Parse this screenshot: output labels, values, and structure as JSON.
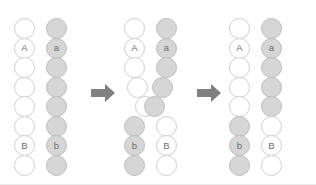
{
  "figure": {
    "background_color": "#ffffff",
    "width": 316,
    "height": 185
  },
  "legend": {
    "white_label": "non-recombinant parental chromatid (dominant alleles)",
    "grey_label": "homologous chromatid (recessive alleles)",
    "white_color": "#ffffff",
    "grey_color": "#d6d6d6",
    "outline_color": "#c9c9c9",
    "label_text_color": "#6e6e6e",
    "arrow_color": "#808080"
  },
  "alleles": {
    "A": "A",
    "a": "a",
    "B": "B",
    "b": "b"
  },
  "arrows": [
    {
      "name": "arrow-step-1",
      "direction": "right",
      "symbol": "➡"
    },
    {
      "name": "arrow-step-2",
      "direction": "right",
      "symbol": "➡"
    }
  ],
  "panels": [
    {
      "name": "panel-before",
      "caption": "Synapsis: homologous chromatids aligned",
      "chromatids": [
        {
          "name": "chromatid-left-parental",
          "beads": [
            {
              "color": "white",
              "label": "",
              "row": 0,
              "shift": 0
            },
            {
              "color": "white",
              "label": "A",
              "row": 1,
              "shift": 0
            },
            {
              "color": "white",
              "label": "",
              "row": 2,
              "shift": 0
            },
            {
              "color": "white",
              "label": "",
              "row": 3,
              "shift": 0
            },
            {
              "color": "white",
              "label": "",
              "row": 4,
              "shift": 0
            },
            {
              "color": "white",
              "label": "",
              "row": 5,
              "shift": 0
            },
            {
              "color": "white",
              "label": "B",
              "row": 6,
              "shift": 0
            },
            {
              "color": "white",
              "label": "",
              "row": 7,
              "shift": 0
            }
          ]
        },
        {
          "name": "chromatid-right-parental",
          "beads": [
            {
              "color": "grey",
              "label": "",
              "row": 0,
              "shift": 0
            },
            {
              "color": "grey",
              "label": "a",
              "row": 1,
              "shift": 0
            },
            {
              "color": "grey",
              "label": "",
              "row": 2,
              "shift": 0
            },
            {
              "color": "grey",
              "label": "",
              "row": 3,
              "shift": 0
            },
            {
              "color": "grey",
              "label": "",
              "row": 4,
              "shift": 0
            },
            {
              "color": "grey",
              "label": "",
              "row": 5,
              "shift": 0
            },
            {
              "color": "grey",
              "label": "b",
              "row": 6,
              "shift": 0
            },
            {
              "color": "grey",
              "label": "",
              "row": 7,
              "shift": 0
            }
          ]
        }
      ]
    },
    {
      "name": "panel-crossover",
      "caption": "Chiasma formation: strands cross and exchange segments",
      "chromatids": [
        {
          "name": "chromatid-left-crossing",
          "beads": [
            {
              "color": "white",
              "label": "",
              "row": 0,
              "shift": 0
            },
            {
              "color": "white",
              "label": "A",
              "row": 1,
              "shift": 0
            },
            {
              "color": "white",
              "label": "",
              "row": 2,
              "shift": 0
            },
            {
              "color": "white",
              "label": "",
              "row": 3,
              "shift": 3
            },
            {
              "color": "white",
              "label": "",
              "row": 4,
              "shift": 11
            },
            {
              "color": "grey",
              "label": "",
              "row": 5,
              "shift": 0
            },
            {
              "color": "grey",
              "label": "b",
              "row": 6,
              "shift": 0
            },
            {
              "color": "grey",
              "label": "",
              "row": 7,
              "shift": 0
            }
          ]
        },
        {
          "name": "chromatid-right-crossing",
          "beads": [
            {
              "color": "grey",
              "label": "",
              "row": 0,
              "shift": 0
            },
            {
              "color": "grey",
              "label": "a",
              "row": 1,
              "shift": 0
            },
            {
              "color": "grey",
              "label": "",
              "row": 2,
              "shift": 0
            },
            {
              "color": "grey",
              "label": "",
              "row": 3,
              "shift": -4
            },
            {
              "color": "grey",
              "label": "",
              "row": 4,
              "shift": -12
            },
            {
              "color": "white",
              "label": "",
              "row": 5,
              "shift": 0
            },
            {
              "color": "white",
              "label": "B",
              "row": 6,
              "shift": 0
            },
            {
              "color": "white",
              "label": "",
              "row": 7,
              "shift": 0
            }
          ]
        }
      ]
    },
    {
      "name": "panel-after",
      "caption": "Recombinant chromatids after exchange",
      "chromatids": [
        {
          "name": "chromatid-left-recombinant",
          "beads": [
            {
              "color": "white",
              "label": "",
              "row": 0,
              "shift": 0
            },
            {
              "color": "white",
              "label": "A",
              "row": 1,
              "shift": 0
            },
            {
              "color": "white",
              "label": "",
              "row": 2,
              "shift": 0
            },
            {
              "color": "white",
              "label": "",
              "row": 3,
              "shift": 0
            },
            {
              "color": "white",
              "label": "",
              "row": 4,
              "shift": 0
            },
            {
              "color": "grey",
              "label": "",
              "row": 5,
              "shift": 0
            },
            {
              "color": "grey",
              "label": "b",
              "row": 6,
              "shift": 0
            },
            {
              "color": "grey",
              "label": "",
              "row": 7,
              "shift": 0
            }
          ]
        },
        {
          "name": "chromatid-right-recombinant",
          "beads": [
            {
              "color": "grey",
              "label": "",
              "row": 0,
              "shift": 0
            },
            {
              "color": "grey",
              "label": "a",
              "row": 1,
              "shift": 0
            },
            {
              "color": "grey",
              "label": "",
              "row": 2,
              "shift": 0
            },
            {
              "color": "grey",
              "label": "",
              "row": 3,
              "shift": 0
            },
            {
              "color": "grey",
              "label": "",
              "row": 4,
              "shift": 0
            },
            {
              "color": "white",
              "label": "",
              "row": 5,
              "shift": 0
            },
            {
              "color": "white",
              "label": "B",
              "row": 6,
              "shift": 0
            },
            {
              "color": "white",
              "label": "",
              "row": 7,
              "shift": 0
            }
          ]
        }
      ]
    }
  ]
}
